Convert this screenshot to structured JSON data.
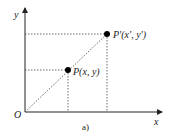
{
  "diagram": {
    "axis_x_label": "x",
    "axis_y_label": "y",
    "origin_label": "O",
    "point_p_label": "P(x, y)",
    "point_p_prime_label": "P'(x', y')",
    "caption": "a)"
  }
}
